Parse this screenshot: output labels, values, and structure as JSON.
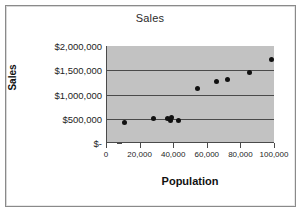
{
  "chart_data": {
    "type": "scatter",
    "title": "Sales",
    "xlabel": "Population",
    "ylabel": "Sales",
    "xlim": [
      0,
      100000
    ],
    "ylim": [
      0,
      2000000
    ],
    "grid": true,
    "legend": "none",
    "x_ticks": [
      {
        "value": 0,
        "label": "0"
      },
      {
        "value": 20000,
        "label": "20,000"
      },
      {
        "value": 40000,
        "label": "40,000"
      },
      {
        "value": 60000,
        "label": "60,000"
      },
      {
        "value": 80000,
        "label": "80,000"
      },
      {
        "value": 100000,
        "label": "100,000"
      }
    ],
    "y_ticks": [
      {
        "value": 0,
        "label": "$-"
      },
      {
        "value": 500000,
        "label": "$500,000"
      },
      {
        "value": 1000000,
        "label": "$1,000,000"
      },
      {
        "value": 1500000,
        "label": "$1,500,000"
      },
      {
        "value": 2000000,
        "label": "$2,000,000"
      }
    ],
    "gridlines_y": [
      500000,
      1000000,
      1500000
    ],
    "series": [
      {
        "name": "Sales",
        "marker": "diamond",
        "color": "#111111",
        "points": [
          {
            "x": 10500,
            "y": 420000
          },
          {
            "x": 27500,
            "y": 510000
          },
          {
            "x": 36000,
            "y": 500000
          },
          {
            "x": 37500,
            "y": 470000
          },
          {
            "x": 38500,
            "y": 520000
          },
          {
            "x": 42500,
            "y": 455000
          },
          {
            "x": 54000,
            "y": 1120000
          },
          {
            "x": 65000,
            "y": 1265000
          },
          {
            "x": 72000,
            "y": 1305000
          },
          {
            "x": 85000,
            "y": 1450000
          },
          {
            "x": 98000,
            "y": 1720000
          }
        ]
      }
    ],
    "plot_background": "#c2c2c2",
    "axis_color": "#4a4a4a"
  }
}
